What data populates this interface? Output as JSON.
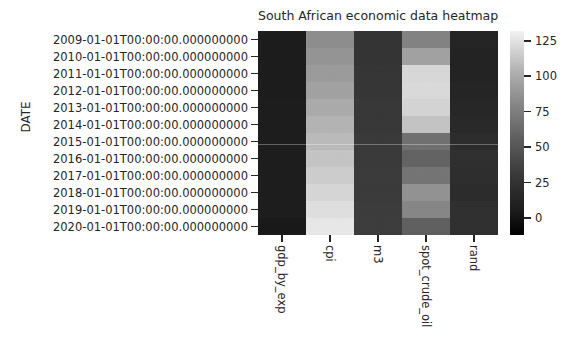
{
  "chart_data": {
    "type": "heatmap",
    "title": "South African economic data heatmap",
    "xlabel": "",
    "ylabel": "DATE",
    "grid": false,
    "legend": "colorbar-right",
    "colormap": "gray",
    "colorbar": {
      "ticks": [
        0,
        25,
        50,
        75,
        100,
        125
      ],
      "tick_labels": [
        "0",
        "25",
        "50",
        "75",
        "100",
        "125"
      ],
      "vmin": -12,
      "vmax": 132,
      "low_color": "#000000",
      "high_color": "#f2f2f2"
    },
    "columns": [
      "gdp_by_exp",
      "cpi",
      "m3",
      "spot_crude_oil",
      "rand"
    ],
    "rows": [
      "2009-01-01T00:00:00.000000000",
      "2010-01-01T00:00:00.000000000",
      "2011-01-01T00:00:00.000000000",
      "2012-01-01T00:00:00.000000000",
      "2013-01-01T00:00:00.000000000",
      "2014-01-01T00:00:00.000000000",
      "2015-01-01T00:00:00.000000000",
      "2016-01-01T00:00:00.000000000",
      "2017-01-01T00:00:00.000000000",
      "2018-01-01T00:00:00.000000000",
      "2019-01-01T00:00:00.000000000",
      "2020-01-01T00:00:00.000000000"
    ],
    "series": [
      {
        "name": "gdp_by_exp",
        "values": [
          3.0,
          3.2,
          3.4,
          3.5,
          3.6,
          3.6,
          3.7,
          3.7,
          3.8,
          3.8,
          3.8,
          1.5
        ]
      },
      {
        "name": "cpi",
        "values": [
          68,
          72,
          76,
          80,
          85,
          90,
          94,
          100,
          105,
          110,
          115,
          120
        ]
      },
      {
        "name": "m3",
        "values": [
          17,
          17,
          18,
          18,
          19,
          19,
          20,
          20,
          21,
          21,
          22,
          22
        ]
      },
      {
        "name": "spot_crude_oil",
        "values": [
          62,
          80,
          111,
          112,
          109,
          99,
          52,
          44,
          54,
          71,
          64,
          42
        ]
      },
      {
        "name": "rand",
        "values": [
          8.4,
          7.3,
          7.3,
          8.2,
          9.6,
          10.8,
          12.8,
          14.7,
          13.3,
          12.3,
          14.4,
          14.8
        ]
      }
    ]
  },
  "figure": {
    "title": "South African economic data heatmap",
    "y_axis_label": "DATE"
  }
}
